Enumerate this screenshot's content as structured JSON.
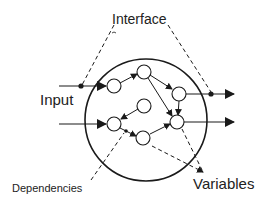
{
  "diagram": {
    "labels": {
      "interface": "Interface",
      "input": "Input",
      "dependencies": "Dependencies",
      "variables": "Variables"
    },
    "colors": {
      "stroke": "#1a1a1a",
      "background": "#ffffff"
    },
    "boundary": {
      "shape": "circle",
      "cx": 146,
      "cy": 120,
      "r": 61
    },
    "nodes": [
      {
        "id": "A",
        "cx": 114,
        "cy": 86
      },
      {
        "id": "B",
        "cx": 144,
        "cy": 72
      },
      {
        "id": "C",
        "cx": 179,
        "cy": 94
      },
      {
        "id": "D",
        "cx": 144,
        "cy": 106
      },
      {
        "id": "E",
        "cx": 114,
        "cy": 124
      },
      {
        "id": "F",
        "cx": 143,
        "cy": 138
      },
      {
        "id": "G",
        "cx": 177,
        "cy": 122
      }
    ],
    "edges": [
      [
        "input1",
        "A"
      ],
      [
        "input2",
        "E"
      ],
      [
        "A",
        "B"
      ],
      [
        "B",
        "C"
      ],
      [
        "B",
        "G"
      ],
      [
        "C",
        "G"
      ],
      [
        "D",
        "E"
      ],
      [
        "E",
        "F"
      ],
      [
        "F",
        "G"
      ],
      [
        "C",
        "output1"
      ],
      [
        "G",
        "output2"
      ]
    ]
  }
}
